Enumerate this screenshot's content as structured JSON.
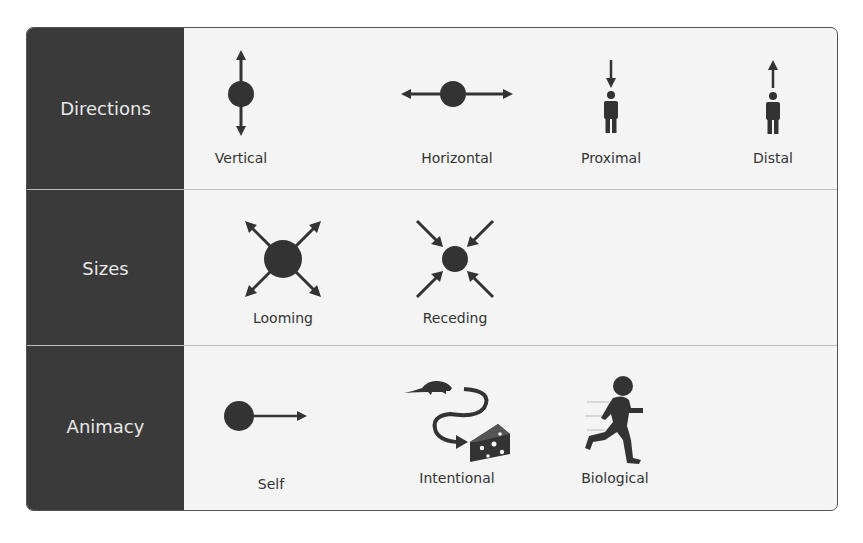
{
  "rows": [
    {
      "label": "Directions",
      "items": [
        {
          "label": "Vertical",
          "icon": "vertical-arrow-ball-icon"
        },
        {
          "label": "Horizontal",
          "icon": "horizontal-arrow-ball-icon"
        },
        {
          "label": "Proximal",
          "icon": "person-arrow-down-icon"
        },
        {
          "label": "Distal",
          "icon": "person-arrow-up-icon"
        }
      ]
    },
    {
      "label": "Sizes",
      "items": [
        {
          "label": "Looming",
          "icon": "looming-arrows-out-icon"
        },
        {
          "label": "Receding",
          "icon": "receding-arrows-in-icon"
        }
      ]
    },
    {
      "label": "Animacy",
      "items": [
        {
          "label": "Self",
          "icon": "ball-arrow-right-icon"
        },
        {
          "label": "Intentional",
          "icon": "mouse-path-cheese-icon"
        },
        {
          "label": "Biological",
          "icon": "running-child-icon"
        }
      ]
    }
  ],
  "colors": {
    "left_panel": "#3a3a3a",
    "content_bg": "#f4f4f4",
    "icon": "#333333",
    "label_text": "#e8e8e8"
  }
}
